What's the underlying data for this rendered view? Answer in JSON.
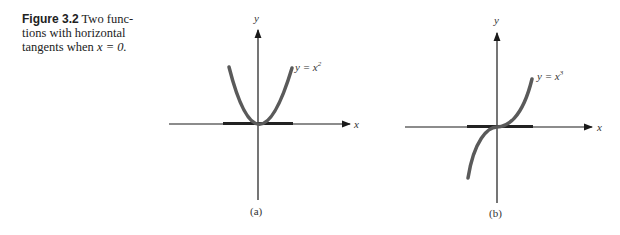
{
  "caption": {
    "figure_label": "Figure 3.2",
    "text_line1": " Two func-",
    "text_line2": "tions with horizontal",
    "text_line3_pre": "tangents when ",
    "text_line3_math": "x = 0."
  },
  "graphs": [
    {
      "id": "a",
      "sublabel": "(a)",
      "x_axis_label": "x",
      "y_axis_label": "y",
      "curve_label_base": "y = x",
      "curve_label_exp": "2",
      "function": "y = x^2"
    },
    {
      "id": "b",
      "sublabel": "(b)",
      "x_axis_label": "x",
      "y_axis_label": "y",
      "curve_label_base": "y = x",
      "curve_label_exp": "3",
      "function": "y = x^3"
    }
  ],
  "colors": {
    "axis": "#1a1a1a",
    "curve": "#5a5a5a",
    "tangent": "#222222"
  }
}
